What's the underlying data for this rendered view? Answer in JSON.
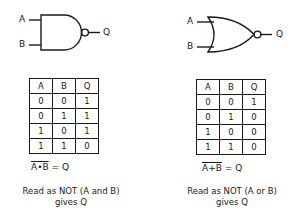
{
  "nand": {
    "gate_type": "NAND",
    "input_a": "A",
    "input_b": "B",
    "output": "Q",
    "table": {
      "headers": [
        "A",
        "B",
        "Q"
      ],
      "rows": [
        [
          "0",
          "0",
          "1"
        ],
        [
          "0",
          "1",
          "1"
        ],
        [
          "1",
          "0",
          "1"
        ],
        [
          "1",
          "1",
          "0"
        ]
      ]
    },
    "expr_over": "A•B",
    "expr_rest": " = Q",
    "caption_line1": "Read as  NOT (A and B)",
    "caption_line2": "gives Q"
  },
  "nor": {
    "gate_type": "NOR",
    "input_a": "A",
    "input_b": "B",
    "output": "Q",
    "table": {
      "headers": [
        "A",
        "B",
        "Q"
      ],
      "rows": [
        [
          "0",
          "0",
          "1"
        ],
        [
          "0",
          "1",
          "0"
        ],
        [
          "1",
          "0",
          "0"
        ],
        [
          "1",
          "1",
          "0"
        ]
      ]
    },
    "expr_over": "A+B",
    "expr_rest": " = Q",
    "caption_line1": "Read as  NOT (A or B)",
    "caption_line2": "gives Q"
  },
  "colors": {
    "ink": "#1a1a1a",
    "background": "#ffffff"
  }
}
